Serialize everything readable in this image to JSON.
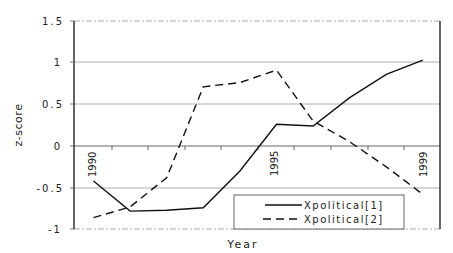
{
  "chart_data": {
    "type": "line",
    "title": "",
    "xlabel": "Year",
    "ylabel": "z-score",
    "ylim": [
      -1,
      1.5
    ],
    "yticks": [
      "1.5",
      "1",
      "0.5",
      "0",
      "-0.5",
      "-1"
    ],
    "x": [
      1990,
      1991,
      1992,
      1993,
      1994,
      1995,
      1996,
      1997,
      1998,
      1999
    ],
    "x_tick_labels_shown": [
      "1990",
      "1995",
      "1999"
    ],
    "grid": true,
    "legend_position": "lower-right inside plot",
    "series": [
      {
        "name": "Xpolitical[1]",
        "style": "solid",
        "values": [
          -0.42,
          -0.78,
          -0.77,
          -0.74,
          -0.3,
          0.26,
          0.24,
          0.58,
          0.86,
          1.03
        ]
      },
      {
        "name": "Xpolitical[2]",
        "style": "dashed",
        "values": [
          -0.86,
          -0.73,
          -0.38,
          0.71,
          0.76,
          0.91,
          0.3,
          0.05,
          -0.25,
          -0.58
        ]
      }
    ]
  },
  "labels": {
    "ylabel": "z-score",
    "xlabel": "Year",
    "legend1": "Xpolitical[1]",
    "legend2": "Xpolitical[2]",
    "yt0": "1.5",
    "yt1": "1",
    "yt2": "0.5",
    "yt3": "0",
    "yt4": "-0.5",
    "yt5": "-1",
    "xt0": "1990",
    "xt1": "1995",
    "xt2": "1999"
  }
}
